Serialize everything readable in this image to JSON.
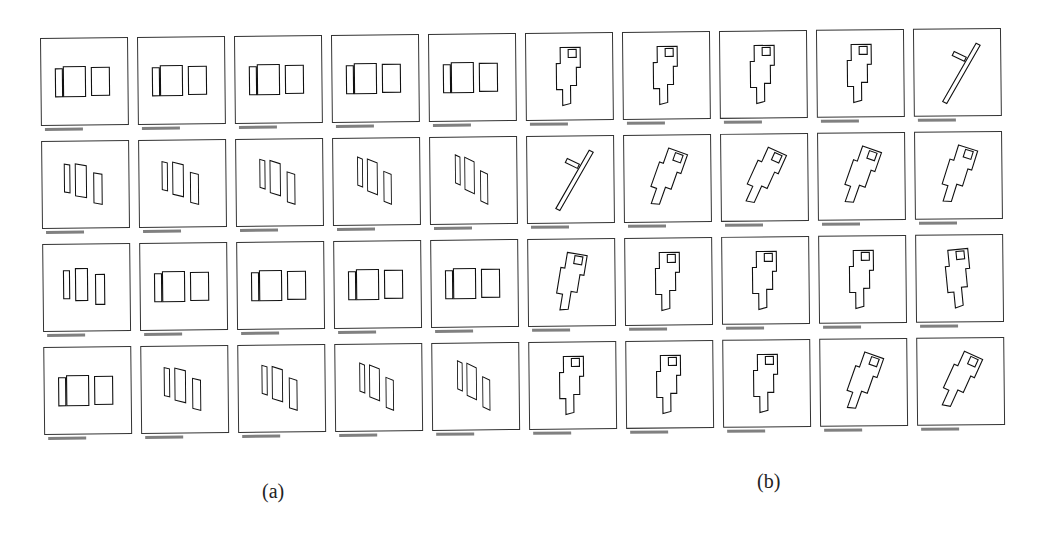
{
  "figure": {
    "panels": [
      {
        "label": "(a)",
        "description": "Sequence of thumbnails showing three rectangular segments rotating",
        "rows": 4,
        "cols": 5
      },
      {
        "label": "(b)",
        "description": "Sequence of thumbnails showing an irregular polygon shape rotating",
        "rows": 4,
        "cols": 5
      }
    ],
    "caption_text": "illegible",
    "grid": {
      "rows": 4,
      "cols": 10
    }
  }
}
